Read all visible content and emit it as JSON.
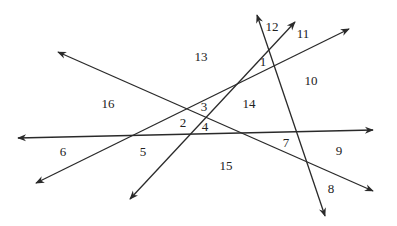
{
  "diagram": {
    "type": "intersecting-lines-regions",
    "line_color": "#2a2a2a",
    "text_color": "#222222",
    "lines": [
      {
        "id": "A",
        "x1": 18,
        "y1": 138,
        "x2": 373,
        "y2": 130,
        "arrows": "both"
      },
      {
        "id": "B",
        "x1": 257,
        "y1": 15,
        "x2": 325,
        "y2": 216,
        "arrows": "both"
      },
      {
        "id": "C",
        "x1": 58,
        "y1": 52,
        "x2": 373,
        "y2": 191,
        "arrows": "both"
      },
      {
        "id": "D",
        "x1": 36,
        "y1": 183,
        "x2": 349,
        "y2": 29,
        "arrows": "both"
      },
      {
        "id": "E",
        "x1": 130,
        "y1": 199,
        "x2": 295,
        "y2": 22,
        "arrows": "both"
      }
    ],
    "labels": [
      {
        "text": "1",
        "x": 263,
        "y": 63
      },
      {
        "text": "2",
        "x": 183,
        "y": 124
      },
      {
        "text": "3",
        "x": 204,
        "y": 108
      },
      {
        "text": "4",
        "x": 205,
        "y": 128
      },
      {
        "text": "5",
        "x": 143,
        "y": 153
      },
      {
        "text": "6",
        "x": 63,
        "y": 153
      },
      {
        "text": "7",
        "x": 286,
        "y": 144
      },
      {
        "text": "8",
        "x": 331,
        "y": 190
      },
      {
        "text": "9",
        "x": 339,
        "y": 152
      },
      {
        "text": "10",
        "x": 311,
        "y": 82
      },
      {
        "text": "11",
        "x": 303,
        "y": 35
      },
      {
        "text": "12",
        "x": 272,
        "y": 28
      },
      {
        "text": "13",
        "x": 201,
        "y": 58
      },
      {
        "text": "14",
        "x": 249,
        "y": 105
      },
      {
        "text": "15",
        "x": 226,
        "y": 167
      },
      {
        "text": "16",
        "x": 108,
        "y": 105
      }
    ]
  }
}
